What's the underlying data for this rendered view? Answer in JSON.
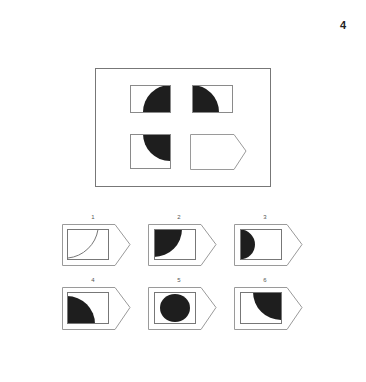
{
  "page": {
    "number": "4"
  },
  "question": {
    "cells": [
      {
        "position": "top-left",
        "shape": "quarter-circle",
        "fill": "bottom-right quadrant of circle"
      },
      {
        "position": "top-right",
        "shape": "quarter-circle",
        "fill": "bottom-left quadrant of circle"
      },
      {
        "position": "bottom-left",
        "shape": "quarter-circle",
        "fill": "top-right quadrant of circle"
      },
      {
        "position": "bottom-right",
        "shape": "blank-pentagon",
        "fill": "missing answer"
      }
    ]
  },
  "options": [
    {
      "label": "1",
      "description": "outline quarter arc, no fill"
    },
    {
      "label": "2",
      "description": "filled quarter circle, top-left"
    },
    {
      "label": "3",
      "description": "filled half circle, left"
    },
    {
      "label": "4",
      "description": "filled quarter circle, bottom-left"
    },
    {
      "label": "5",
      "description": "filled circle, center"
    },
    {
      "label": "6",
      "description": "filled quarter circle, top-right"
    }
  ],
  "colors": {
    "stroke": "#8a8a8a",
    "fill": "#1e1e1e",
    "background": "#ffffff"
  }
}
